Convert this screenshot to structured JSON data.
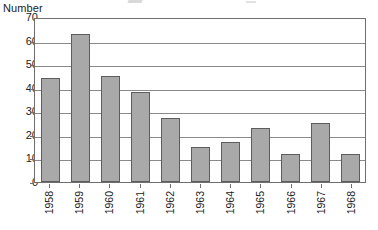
{
  "chart_data": {
    "type": "bar",
    "title": "",
    "subtitle": "",
    "xlabel": "",
    "ylabel": "Number",
    "categories": [
      "1958",
      "1959",
      "1960",
      "1961",
      "1962",
      "1963",
      "1964",
      "1965",
      "1966",
      "1967",
      "1968"
    ],
    "values": [
      44,
      63,
      45,
      38,
      27,
      15,
      17,
      23,
      12,
      25,
      12
    ],
    "ylim": [
      0,
      70
    ],
    "yticks": [
      70,
      60,
      50,
      40,
      30,
      20,
      10,
      0
    ],
    "ytick_labels": [
      "70",
      "60",
      "50",
      "40",
      "30",
      "20",
      "10",
      "0"
    ],
    "grid": "horizontal",
    "legend": "none",
    "xlabel_rotation": -90,
    "bar_fill_color": "#a9a9a9",
    "bar_border_color": "#5d5d5d",
    "gridline_color": "#8a8a8a",
    "axis_color": "#6f6f6f",
    "background_color": "#ffffff",
    "annotations": []
  }
}
